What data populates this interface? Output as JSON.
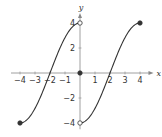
{
  "chart_data": {
    "type": "line",
    "title": "",
    "xlabel": "x",
    "ylabel": "y",
    "xlim": [
      -4.6,
      4.9
    ],
    "ylim": [
      -4.5,
      4.8
    ],
    "grid": false,
    "x_ticks": [
      -4,
      -3,
      -2,
      -1,
      1,
      2,
      3,
      4
    ],
    "x_tick_labels": [
      "−4",
      "−3",
      "−2",
      "−1",
      "1",
      "2",
      "3",
      "4"
    ],
    "y_ticks": [
      4,
      2,
      -2,
      -4
    ],
    "y_tick_labels": [
      "4",
      "2",
      "−2",
      "−4"
    ],
    "series": [
      {
        "name": "left-branch",
        "description": "f(x) = 4 sin(π(x+2)/4) on [-4, 0)",
        "x": [
          -4,
          -3.5,
          -3,
          -2.5,
          -2,
          -1.5,
          -1,
          -0.5,
          0
        ],
        "y": [
          -4,
          -3.7,
          -2.83,
          -1.53,
          0,
          1.53,
          2.83,
          3.7,
          4
        ]
      },
      {
        "name": "right-branch",
        "description": "f(x) = 4 sin(π(x-2)/4) on (0, 4]",
        "x": [
          0,
          0.5,
          1,
          1.5,
          2,
          2.5,
          3,
          3.5,
          4
        ],
        "y": [
          -4,
          -3.7,
          -2.83,
          -1.53,
          0,
          1.53,
          2.83,
          3.7,
          4
        ]
      }
    ],
    "points": [
      {
        "x": -4,
        "y": -4,
        "style": "closed"
      },
      {
        "x": 0,
        "y": 4,
        "style": "open"
      },
      {
        "x": 0,
        "y": 0,
        "style": "closed"
      },
      {
        "x": 0,
        "y": -4,
        "style": "open"
      },
      {
        "x": 4,
        "y": 4,
        "style": "closed"
      }
    ],
    "colors": {
      "curve": "#333333",
      "axis": "#888888"
    }
  }
}
